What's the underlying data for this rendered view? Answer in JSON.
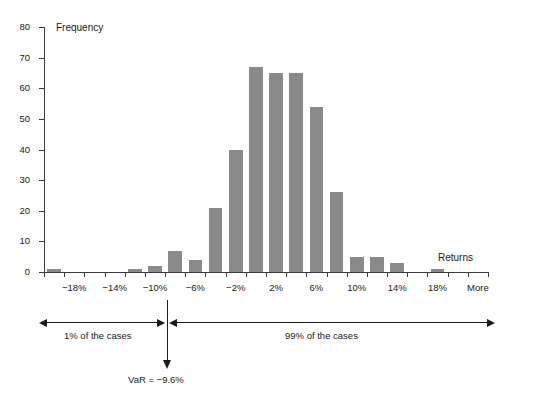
{
  "chart_data": {
    "type": "bar",
    "title": "",
    "xlabel": "Returns",
    "ylabel": "Frequency",
    "ylim": [
      0,
      80
    ],
    "ytick_values": [
      0,
      10,
      20,
      30,
      40,
      50,
      60,
      70,
      80
    ],
    "ytick_labels": [
      "0",
      "10",
      "20",
      "30",
      "40",
      "50",
      "60",
      "70",
      "80"
    ],
    "xtick_labels": [
      "−18%",
      "−14%",
      "−10%",
      "−6%",
      "−2%",
      "2%",
      "6%",
      "10%",
      "14%",
      "18%",
      "More"
    ],
    "grid": false,
    "legend": "none",
    "bar_color": "#8a8a8a",
    "axis_color": "#3a3a3a",
    "categories": [
      "−20%",
      "−18%",
      "−16%",
      "−14%",
      "−12%",
      "−10%",
      "−8%",
      "−6%",
      "−4%",
      "−2%",
      "0%",
      "2%",
      "4%",
      "6%",
      "8%",
      "10%",
      "12%",
      "14%",
      "16%",
      "18%",
      "20%",
      "More"
    ],
    "values": [
      1,
      0,
      0,
      0,
      1,
      2,
      7,
      4,
      21,
      40,
      67,
      65,
      65,
      54,
      26,
      5,
      5,
      3,
      0,
      1,
      0,
      0
    ]
  },
  "axes": {
    "ylabel": "Frequency",
    "xlabel": "Returns"
  },
  "annotations": {
    "left_span_label": "1% of the cases",
    "right_span_label": "99% of the cases",
    "var_label": "VaR = −9.6%"
  }
}
